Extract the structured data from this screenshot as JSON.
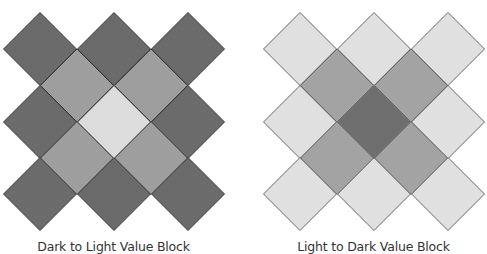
{
  "blocks": [
    {
      "id": "dark-to-light",
      "caption": "Dark to Light Value Block",
      "origin_x": 0,
      "colors": {
        "outer": "#6b6b6b",
        "ring": "#9e9e9e",
        "center": "#dcdcdc"
      },
      "stroke": "#3a3a3a"
    },
    {
      "id": "light-to-dark",
      "caption": "Light to Dark Value Block",
      "origin_x": 260,
      "colors": {
        "outer": "#e0e0e0",
        "ring": "#a3a3a3",
        "center": "#6e6e6e"
      },
      "stroke": "#6a6a6a"
    }
  ],
  "grid": {
    "half_diagonal": 36.5,
    "outer_cells": [
      [
        40,
        49
      ],
      [
        114,
        49
      ],
      [
        188,
        49
      ],
      [
        40,
        122
      ],
      [
        188,
        122
      ],
      [
        40,
        194
      ],
      [
        114,
        194
      ],
      [
        188,
        194
      ]
    ],
    "ring_cells": [
      [
        77,
        85.5
      ],
      [
        151,
        85.5
      ],
      [
        77,
        158
      ],
      [
        151,
        158
      ]
    ],
    "center_cell": [
      114,
      122
    ]
  }
}
